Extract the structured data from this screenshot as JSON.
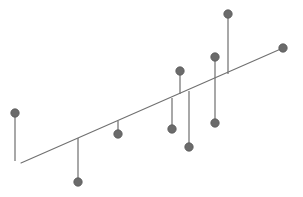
{
  "figure": {
    "width": 303,
    "height": 197,
    "background_color": "#ffffff",
    "title": "",
    "xlabel": "",
    "ylabel": ""
  },
  "style": {
    "line_color": "#6e6e6e",
    "marker_color": "#6b6b6b",
    "marker_edge_color": "#595959",
    "baseline_color": "#707070",
    "baseline_width": 1.1,
    "stem_width": 1.2,
    "marker_radius": 4.2
  },
  "chart_data": {
    "type": "scatter",
    "title": "",
    "subtitle": "",
    "xlabel": "",
    "ylabel": "",
    "grid": false,
    "legend": null,
    "baseline": {
      "name": "baseline",
      "x_start": 21,
      "y_start": 163,
      "x_end": 283,
      "y_end": 48,
      "endpoint_marker": true
    },
    "stems": [
      {
        "id": "s1",
        "x": 15,
        "baseline_y": 161,
        "marker_y": 113,
        "direction": "up",
        "length": 48
      },
      {
        "id": "s2",
        "x": 78,
        "baseline_y": 138,
        "marker_y": 182,
        "direction": "down",
        "length": 44
      },
      {
        "id": "s3",
        "x": 118,
        "baseline_y": 121,
        "marker_y": 134,
        "direction": "down",
        "length": 13
      },
      {
        "id": "s4",
        "x": 180,
        "baseline_y": 94,
        "marker_y": 71,
        "direction": "up",
        "length": 23
      },
      {
        "id": "s5",
        "x": 172,
        "baseline_y": 98,
        "marker_y": 129,
        "direction": "down",
        "length": 31
      },
      {
        "id": "s6",
        "x": 189,
        "baseline_y": 91,
        "marker_y": 147,
        "direction": "down",
        "length": 56
      },
      {
        "id": "s7",
        "x": 215,
        "baseline_y": 79,
        "marker_y": 57,
        "direction": "up",
        "length": 22
      },
      {
        "id": "s8",
        "x": 215,
        "baseline_y": 79,
        "marker_y": 123,
        "direction": "down",
        "length": 44
      },
      {
        "id": "s9",
        "x": 228,
        "baseline_y": 74,
        "marker_y": 14,
        "direction": "up",
        "length": 60
      }
    ],
    "markers": [
      {
        "id": "m1",
        "x": 15,
        "y": 113
      },
      {
        "id": "m2",
        "x": 78,
        "y": 182
      },
      {
        "id": "m3",
        "x": 118,
        "y": 134
      },
      {
        "id": "m4",
        "x": 180,
        "y": 71
      },
      {
        "id": "m5",
        "x": 172,
        "y": 129
      },
      {
        "id": "m6",
        "x": 189,
        "y": 147
      },
      {
        "id": "m7",
        "x": 215,
        "y": 57
      },
      {
        "id": "m8",
        "x": 215,
        "y": 123
      },
      {
        "id": "m9",
        "x": 228,
        "y": 14
      },
      {
        "id": "m10",
        "x": 283,
        "y": 48
      }
    ]
  }
}
